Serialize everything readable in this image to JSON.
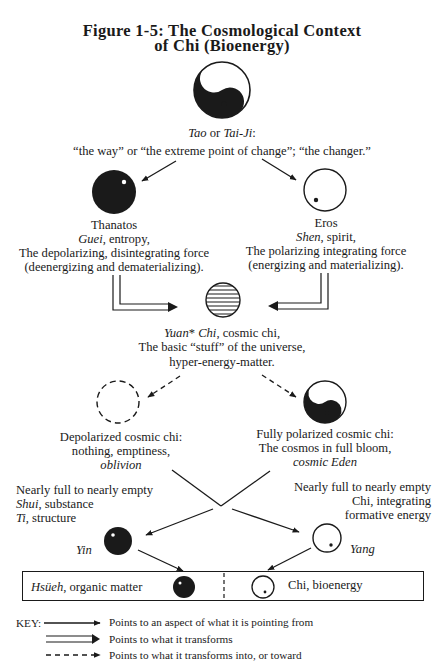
{
  "title": {
    "line1": "Figure 1-5: The Cosmological Context",
    "line2": "of Chi (Bioenergy)"
  },
  "tao": {
    "name_italic_1": "Tao",
    "name_or": " or ",
    "name_italic_2": "Tai-Ji",
    "name_colon": ":",
    "description": "“the way” or “the extreme point of change”; “the changer.”",
    "icon": "yin-yang-icon"
  },
  "thanatos": {
    "name": "Thanatos",
    "term_italic": "Guei",
    "term_rest": ", entropy,",
    "line3": "The depolarizing, disintegrating force",
    "line4": "(deenergizing and dematerializing).",
    "icon": "filled-circle-with-white-dot-icon"
  },
  "eros": {
    "name": "Eros",
    "term_italic": "Shen",
    "term_rest": ", spirit,",
    "line3": "The polarizing integrating force",
    "line4": "(energizing and materializing).",
    "icon": "empty-circle-with-black-dot-icon"
  },
  "yuan_chi": {
    "term_italic": "Yuan",
    "asterisk": "* ",
    "term_italic_2": "Chi",
    "term_rest": ", cosmic chi,",
    "line2": "The basic “stuff” of the universe,",
    "line3": "hyper-energy-matter.",
    "icon": "striped-circle-icon"
  },
  "depolarized": {
    "line1": "Depolarized cosmic chi:",
    "line2": "nothing, emptiness,",
    "line3_italic": "oblivion",
    "icon": "dashed-circle-icon"
  },
  "polarized": {
    "line1": "Fully polarized cosmic chi:",
    "line2": "The cosmos in full bloom,",
    "line3_italic": "cosmic  Eden",
    "icon": "yin-yang-icon"
  },
  "yin_side": {
    "line1": "Nearly full to nearly empty",
    "line2_italic": "Shui",
    "line2_rest": ", substance",
    "line3_italic": "Ti",
    "line3_rest": ", structure",
    "label_italic": "Yin"
  },
  "yang_side": {
    "line1": "Nearly full to nearly empty",
    "line2": "Chi, integrating",
    "line3": "formative energy",
    "label_italic": "Yang"
  },
  "bottom_box": {
    "left_italic": "Hsüeh",
    "left_rest": ", organic matter",
    "right": "Chi, bioenergy"
  },
  "key": {
    "label": "KEY:",
    "items": [
      {
        "arrow": "solid-arrow",
        "text": "Points to an aspect of what it is pointing from"
      },
      {
        "arrow": "double-line-arrow",
        "text": "Points to what it transforms"
      },
      {
        "arrow": "dashed-arrow",
        "text": "Points to what it transforms into, or toward"
      }
    ]
  },
  "colors": {
    "ink": "#1a1a1a",
    "paper": "#ffffff"
  }
}
